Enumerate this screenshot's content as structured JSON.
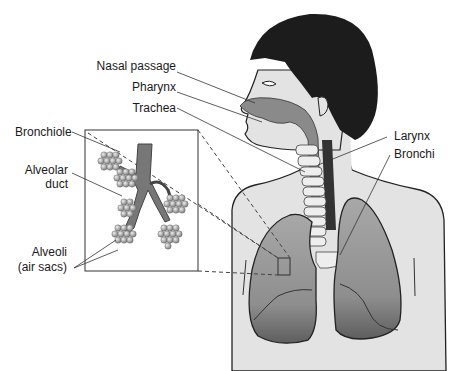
{
  "diagram": {
    "labels": {
      "nasal_passage": "Nasal passage",
      "pharynx": "Pharynx",
      "trachea": "Trachea",
      "bronchiole": "Bronchiole",
      "alveolar_duct_line1": "Alveolar",
      "alveolar_duct_line2": "duct",
      "alveoli_line1": "Alveoli",
      "alveoli_line2": "(air sacs)",
      "larynx": "Larynx",
      "bronchi": "Bronchi"
    },
    "colors": {
      "skin": "#e6e6e6",
      "hair": "#1c1c1c",
      "airway": "#8a8a8a",
      "lung": "#9a9a9a",
      "lung_dark": "#5a5a5a",
      "outline": "#222222"
    }
  }
}
